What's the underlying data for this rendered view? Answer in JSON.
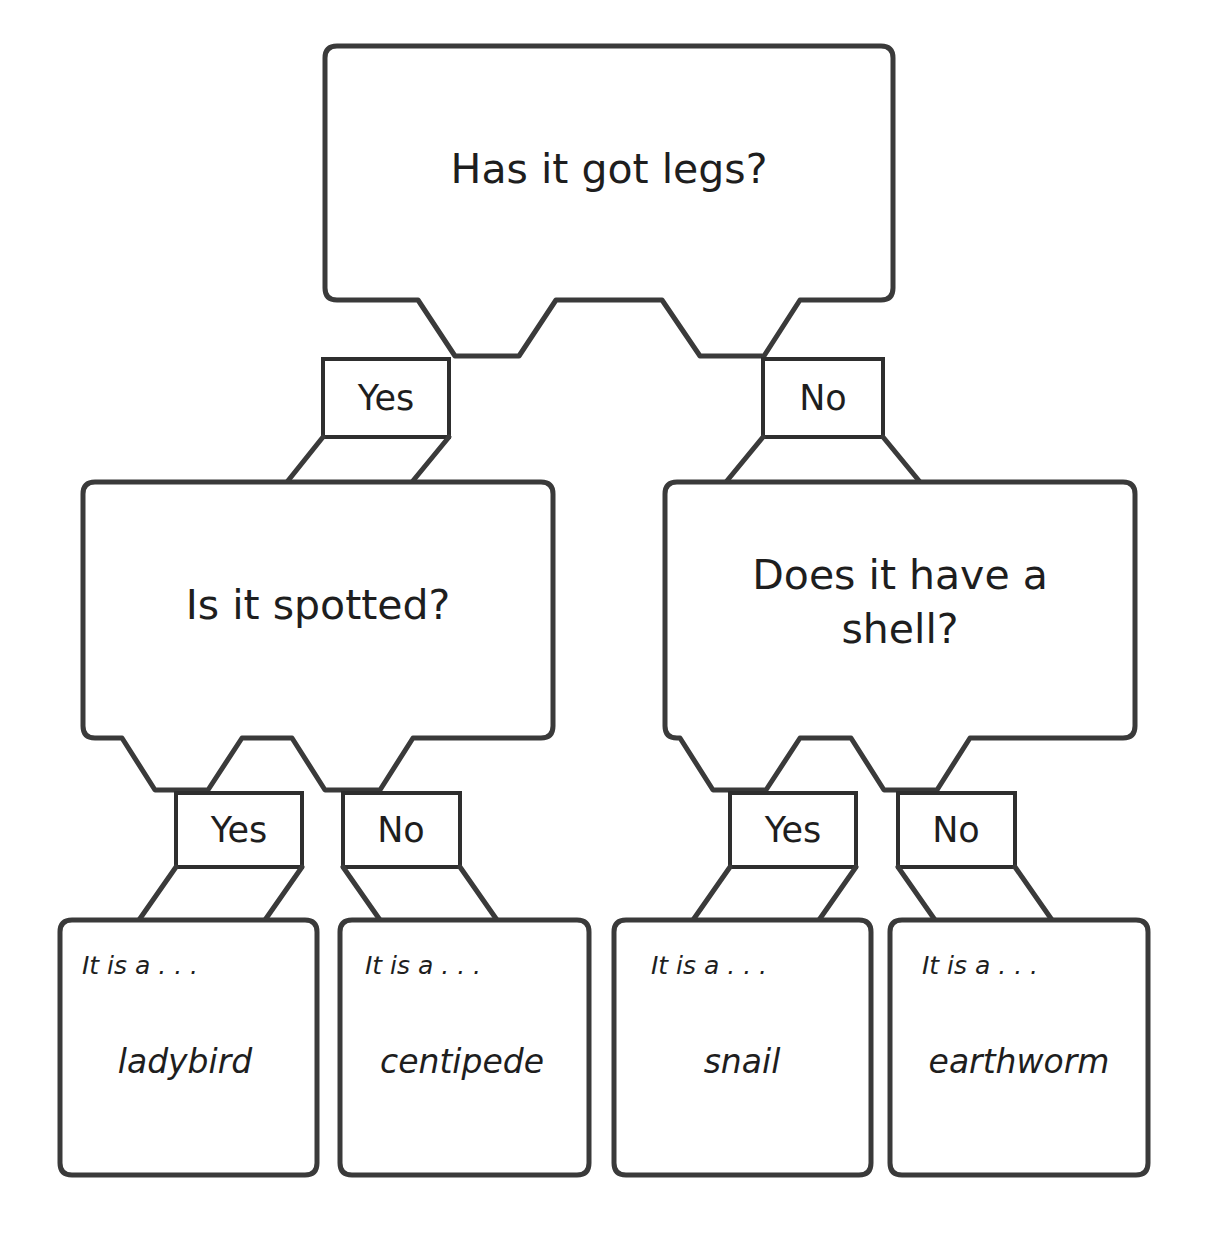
{
  "diagram": {
    "type": "decision-tree",
    "stroke_color": "#3a3a3a",
    "background_color": "#ffffff",
    "text_color": "#1e1e1e"
  },
  "nodes": {
    "root": {
      "id": "q1",
      "text": "Has it got legs?",
      "lines": [
        "Has it got legs?"
      ]
    },
    "level2": [
      {
        "id": "q2",
        "text": "Is it spotted?",
        "lines": [
          "Is it spotted?"
        ]
      },
      {
        "id": "q3",
        "text": "Does it have a shell?",
        "lines": [
          "Does it have a",
          "shell?"
        ]
      }
    ]
  },
  "edge_labels": {
    "root_yes": "Yes",
    "root_no": "No",
    "q2_yes": "Yes",
    "q2_no": "No",
    "q3_yes": "Yes",
    "q3_no": "No"
  },
  "leaves": [
    {
      "id": "leaf1",
      "intro": "It is a . . .",
      "answer": "ladybird",
      "path": [
        "Yes",
        "Yes"
      ]
    },
    {
      "id": "leaf2",
      "intro": "It is a . . .",
      "answer": "centipede",
      "path": [
        "Yes",
        "No"
      ]
    },
    {
      "id": "leaf3",
      "intro": "It is a . . .",
      "answer": "snail",
      "path": [
        "No",
        "Yes"
      ]
    },
    {
      "id": "leaf4",
      "intro": "It is a . . .",
      "answer": "earthworm",
      "path": [
        "No",
        "No"
      ]
    }
  ]
}
